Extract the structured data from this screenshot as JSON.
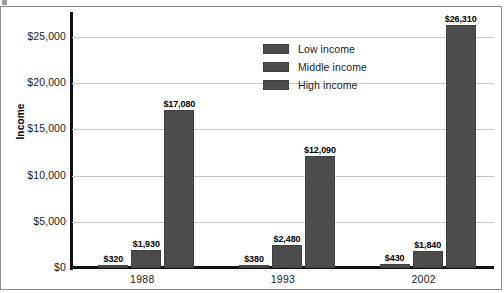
{
  "chart_data": {
    "type": "bar",
    "title": "",
    "xlabel": "",
    "ylabel": "Income",
    "ylim": [
      0,
      27500
    ],
    "grid": true,
    "legend_position": "inside-top-center",
    "categories": [
      "1988",
      "1993",
      "2002"
    ],
    "series": [
      {
        "name": "Low income",
        "color": "#4c4c4c",
        "values": [
          320,
          380,
          430
        ],
        "labels": [
          "$320",
          "$380",
          "$430"
        ]
      },
      {
        "name": "Middle income",
        "color": "#4c4c4c",
        "values": [
          1930,
          2480,
          1840
        ],
        "labels": [
          "$1,930",
          "$2,480",
          "$1,840"
        ]
      },
      {
        "name": "High income",
        "color": "#4c4c4c",
        "values": [
          17080,
          12090,
          26310
        ],
        "labels": [
          "$17,080",
          "$12,090",
          "$26,310"
        ]
      }
    ],
    "yticks": [
      {
        "value": 25000,
        "label": "$25,000"
      },
      {
        "value": 20000,
        "label": "$20,000"
      },
      {
        "value": 15000,
        "label": "$15,000"
      },
      {
        "value": 10000,
        "label": "$10,000"
      },
      {
        "value": 5000,
        "label": "$5,000"
      },
      {
        "value": 0,
        "label": "$0"
      }
    ]
  },
  "legend": {
    "items": [
      {
        "label": "Low income"
      },
      {
        "label": "Middle income"
      },
      {
        "label": "High income"
      }
    ]
  },
  "axis": {
    "y_title": "Income"
  }
}
